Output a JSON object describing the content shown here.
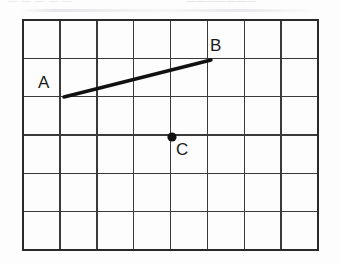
{
  "figure": {
    "type": "geometry-grid-figure",
    "background_color": "#fdfdfd",
    "ink_color": "#1a1a1a",
    "grid_line_color": "#3a3a3a",
    "top_text_remnant": {
      "left_fragment": "—  —   —     — —",
      "right_fragment": "———————"
    },
    "grid": {
      "columns": 8,
      "rows": 6,
      "left": 23,
      "top": 20,
      "right": 318,
      "bottom": 250,
      "cell_width": 36.9,
      "cell_height": 38.3,
      "border_width": 2.2,
      "inner_line_width": 1.4
    },
    "points": [
      {
        "name": "A",
        "label": "A",
        "grid_col": 1,
        "grid_row": 2,
        "x": 64,
        "y": 97,
        "dot": false,
        "label_position": "above-left"
      },
      {
        "name": "B",
        "label": "B",
        "grid_col": 5,
        "grid_row": 1,
        "x": 211,
        "y": 60,
        "dot": false,
        "label_position": "above-right"
      },
      {
        "name": "C",
        "label": "C",
        "grid_col": 4,
        "grid_row": 3,
        "x": 172,
        "y": 137,
        "dot": true,
        "dot_radius": 4.6,
        "label_position": "below-right"
      }
    ],
    "segments": [
      {
        "name": "segment-AB",
        "from": "A",
        "to": "B",
        "x1": 64,
        "y1": 97,
        "x2": 211,
        "y2": 60,
        "stroke_width": 3.4
      }
    ]
  }
}
